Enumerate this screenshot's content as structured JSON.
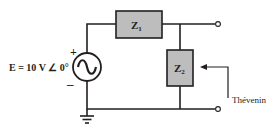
{
  "diagram": {
    "type": "circuit",
    "source": {
      "label": "E = 10 V ∠ 0°",
      "plus": "+",
      "minus": "–",
      "symbol": "ac-voltage-source"
    },
    "components": [
      {
        "id": "Z1",
        "label_main": "Z",
        "label_sub": "1",
        "position": "series-top"
      },
      {
        "id": "Z2",
        "label_main": "Z",
        "label_sub": "2",
        "position": "shunt"
      }
    ],
    "annotation": {
      "label": "Thévenin",
      "points_to": "Z2"
    },
    "terminals": 2,
    "ground": true,
    "colors": {
      "wire": "#231f20",
      "box_fill": "#bdbdbd",
      "box_stroke": "#231f20"
    }
  }
}
